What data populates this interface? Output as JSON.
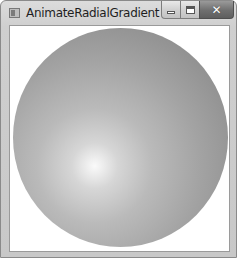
{
  "window": {
    "title": "AnimateRadialGradient",
    "caption_buttons": {
      "minimize": "minimize-icon",
      "maximize": "maximize-icon",
      "close": "close-icon",
      "close_glyph": "✕"
    }
  },
  "content": {
    "shape": "ellipse",
    "fill": "radial-gradient",
    "gradient_colors": {
      "center": "#fafafa",
      "edge": "#868686"
    }
  }
}
